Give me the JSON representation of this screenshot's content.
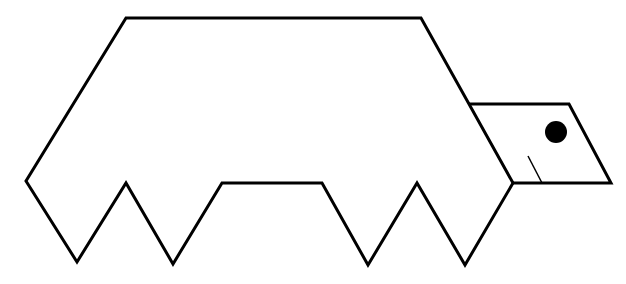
{
  "figure": {
    "background": "#ffffff",
    "stroke_color": "#000000",
    "shell_outline": "126,18 421,18 469,104 513,183 465,265 417,183 368,265 322,183 222,183 173,264 126,183 77,262 26,181",
    "head_outline": "469,104 569,104 611,183 513,183",
    "neck_line": {
      "x1": 469,
      "y1": 104,
      "x2": 513,
      "y2": 183
    },
    "mouth_line": {
      "x1": 528,
      "y1": 156,
      "x2": 542,
      "y2": 183
    },
    "eye": {
      "cx": 556,
      "cy": 132,
      "r": 11
    }
  }
}
